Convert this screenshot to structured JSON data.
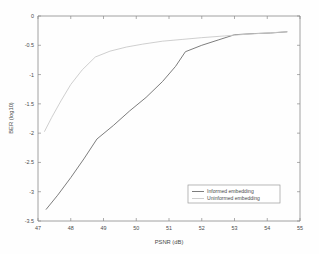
{
  "chart_data": {
    "type": "line",
    "title": "",
    "xlabel": "PSNR (dB)",
    "ylabel": "BER (log10)",
    "xlim": [
      47,
      55
    ],
    "ylim": [
      -3.5,
      0
    ],
    "xticks": [
      47,
      48,
      49,
      50,
      51,
      52,
      53,
      54,
      55
    ],
    "xticklabels": [
      "47",
      "48",
      "49",
      "50",
      "51",
      "52",
      "53",
      "54",
      "55"
    ],
    "yticks": [
      0,
      -0.5,
      -1,
      -1.5,
      -2,
      -2.5,
      -3,
      -3.5
    ],
    "yticklabels": [
      "0",
      "-0.5",
      "-1",
      "-1.5",
      "-2",
      "-2.5",
      "-3",
      "-3.5"
    ],
    "grid": false,
    "legend_position": "lower right",
    "series": [
      {
        "name": "Informed embedding",
        "color": "#6e6e6e",
        "x": [
          47.25,
          47.6,
          48.0,
          48.4,
          48.8,
          49.3,
          49.8,
          50.3,
          50.8,
          51.2,
          51.5,
          52.0,
          52.5,
          53.0,
          53.6,
          54.1,
          54.6
        ],
        "y": [
          -3.3,
          -3.06,
          -2.76,
          -2.44,
          -2.1,
          -1.87,
          -1.62,
          -1.39,
          -1.12,
          -0.86,
          -0.61,
          -0.5,
          -0.41,
          -0.32,
          -0.3,
          -0.29,
          -0.27
        ]
      },
      {
        "name": "Uninformed embedding",
        "color": "#c9c9c9",
        "x": [
          47.2,
          47.42,
          47.7,
          48.0,
          48.35,
          48.75,
          49.2,
          49.7,
          50.2,
          50.8,
          51.4,
          52.0,
          52.7,
          53.4,
          54.0,
          54.6
        ],
        "y": [
          -1.97,
          -1.73,
          -1.45,
          -1.17,
          -0.92,
          -0.7,
          -0.6,
          -0.53,
          -0.48,
          -0.43,
          -0.4,
          -0.37,
          -0.34,
          -0.31,
          -0.29,
          -0.27
        ]
      }
    ]
  },
  "legend": {
    "entries": [
      {
        "label": "Informed embedding"
      },
      {
        "label": "Uninformed embedding"
      }
    ]
  }
}
